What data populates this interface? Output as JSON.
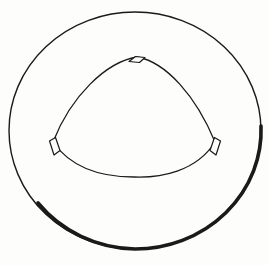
{
  "figure": {
    "background_color": "#fdfdfc",
    "stroke_color": "#1a1a1a",
    "shadow_color": "#000000",
    "canvas": {
      "width": 269,
      "height": 265
    },
    "outer_circle": {
      "name": "outer circle",
      "center_x": 135,
      "center_y": 130.5,
      "radius_x": 126,
      "radius_y": 118.5,
      "stroke_width_light": 1.4,
      "stroke_width_heavy": 3.6,
      "shaded_side": "bottom-right",
      "path": "M 9,130.5 A 126,118.5 0 0 1 135,12 A 126,118.5 0 0 1 261,130.5 A 126,118.5 0 0 1 135,249 A 126,118.5 0 0 1 9,130.5 Z",
      "shadow_path": "M 261,126 A 126,118.5 0 0 1 135,249 A 126,118.5 0 0 1 38,203"
    },
    "inner_triangle": {
      "name": "rounded triangle",
      "description": "Reuleaux-style curved triangle with apex at top and two lower corners",
      "apex_x": 137,
      "apex_y": 57,
      "left_corner_x": 52,
      "left_corner_y": 148,
      "right_corner_x": 216,
      "right_corner_y": 148,
      "bottom_extent_y": 177,
      "stroke_width": 1.3,
      "path": "M 137,57 C 166,62 196,96 215,142 C 196,172 160,178 134,177 C 108,177 74,172 53,142 C 71,96 106,62 137,57 Z"
    },
    "corner_notches": [
      {
        "name": "top notch",
        "position": "apex",
        "center_x": 137,
        "center_y": 59,
        "width": 16,
        "height": 9,
        "path": "M 129,61.5 L 135.5,56.5 L 145,57.5 L 139.5,62.5 Z"
      },
      {
        "name": "left notch",
        "position": "left corner",
        "center_x": 55,
        "center_y": 146,
        "width": 11,
        "height": 17,
        "path": "M 49.5,141 L 55.5,137.5 L 60,150.5 L 54,155 Z"
      },
      {
        "name": "right notch",
        "position": "right corner",
        "center_x": 215,
        "center_y": 146,
        "width": 11,
        "height": 17,
        "path": "M 220.5,141 L 214.5,137.5 L 210,150.5 L 216,155 Z"
      }
    ]
  }
}
